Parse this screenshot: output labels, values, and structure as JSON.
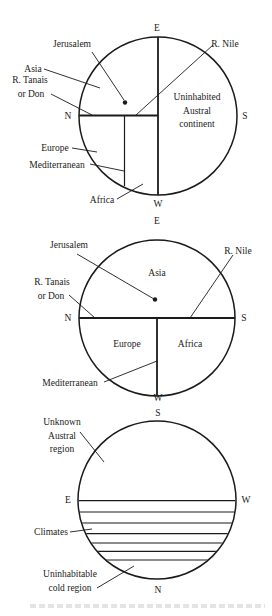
{
  "diagrams": [
    {
      "id": "map1",
      "circle": {
        "cx": 158,
        "cy": 116,
        "r": 79
      },
      "compass": {
        "top": {
          "label": "E",
          "x": 157,
          "y": 30
        },
        "right": {
          "label": "S",
          "x": 246,
          "y": 119
        },
        "bottom": {
          "label": "W",
          "x": 158,
          "y": 208
        },
        "left": {
          "label": "N",
          "x": 68,
          "y": 119
        }
      },
      "labels": {
        "jerusalem": "Jerusalem",
        "asia": "Asia",
        "tanais_1": "R. Tanais",
        "tanais_2": "or Don",
        "nile": "R. Nile",
        "austral_1": "Uninhabited",
        "austral_2": "Austral",
        "austral_3": "continent",
        "europe": "Europe",
        "mediterranean": "Mediterranean",
        "africa": "Africa"
      }
    },
    {
      "id": "map2",
      "circle": {
        "cx": 157,
        "cy": 318,
        "r": 78
      },
      "compass": {
        "top": {
          "label": "E",
          "x": 157,
          "y": 224
        },
        "right": {
          "label": "S",
          "x": 244,
          "y": 321
        },
        "bottom": {
          "label": "W",
          "x": 158,
          "y": 401
        },
        "left": {
          "label": "N",
          "x": 68,
          "y": 321
        }
      },
      "labels": {
        "jerusalem": "Jerusalem",
        "asia": "Asia",
        "tanais_1": "R. Tanais",
        "tanais_2": "or Don",
        "nile": "R. Nile",
        "europe": "Europe",
        "africa": "Africa",
        "mediterranean": "Mediterranean"
      }
    },
    {
      "id": "map3",
      "circle": {
        "cx": 157,
        "cy": 500,
        "r": 79
      },
      "compass": {
        "top": {
          "label": "S",
          "x": 158,
          "y": 416
        },
        "right": {
          "label": "W",
          "x": 246,
          "y": 503
        },
        "bottom": {
          "label": "N",
          "x": 158,
          "y": 593
        },
        "left": {
          "label": "E",
          "x": 68,
          "y": 503
        }
      },
      "climate_lines_y": [
        500.7,
        512,
        523,
        533.7,
        543,
        551.3,
        560
      ],
      "labels": {
        "unknown_1": "Unknown",
        "unknown_2": "Austral",
        "unknown_3": "region",
        "climates": "Climates",
        "cold_1": "Uninhabitable",
        "cold_2": "cold region"
      }
    }
  ]
}
